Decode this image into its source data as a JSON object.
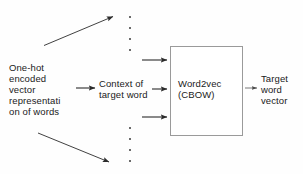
{
  "diagram": {
    "background_color": "#fefefe",
    "stroke_color": "#2b2b2b",
    "box_border_color": "#9a9a9a",
    "text_color": "#1a1a1a",
    "nodes": {
      "input_label": "One-hot\nencoded\nvector\nrepresentati\non of words",
      "context_label": "Context of\ntarget word",
      "model_label": "Word2vec\n(CBOW)",
      "output_label": "Target\nword\nvector"
    },
    "ellipsis": {
      "upper_dots": 4,
      "lower_dots": 4,
      "x": 129,
      "upper_y_positions": [
        16,
        27,
        38,
        49
      ],
      "lower_y_positions": [
        127,
        138,
        149,
        160
      ]
    },
    "arrows": [
      {
        "name": "input-to-upper-ellipsis",
        "type": "diagonal-up",
        "from": [
          44,
          45
        ],
        "to": [
          117,
          16
        ]
      },
      {
        "name": "input-to-context",
        "type": "horizontal",
        "from": [
          76,
          88
        ],
        "to": [
          99,
          88
        ]
      },
      {
        "name": "input-to-lower-ellipsis",
        "type": "diagonal-down",
        "from": [
          38,
          133
        ],
        "to": [
          113,
          163
        ]
      },
      {
        "name": "context-to-model-top",
        "type": "horizontal",
        "from": [
          142,
          60
        ],
        "to": [
          169,
          60
        ]
      },
      {
        "name": "context-to-model-middle",
        "type": "horizontal",
        "from": [
          152,
          89
        ],
        "to": [
          169,
          89
        ]
      },
      {
        "name": "context-to-model-bottom",
        "type": "horizontal",
        "from": [
          142,
          117
        ],
        "to": [
          169,
          117
        ]
      },
      {
        "name": "model-to-output",
        "type": "horizontal-thin",
        "from": [
          244,
          88
        ],
        "to": [
          258,
          88
        ]
      }
    ]
  }
}
